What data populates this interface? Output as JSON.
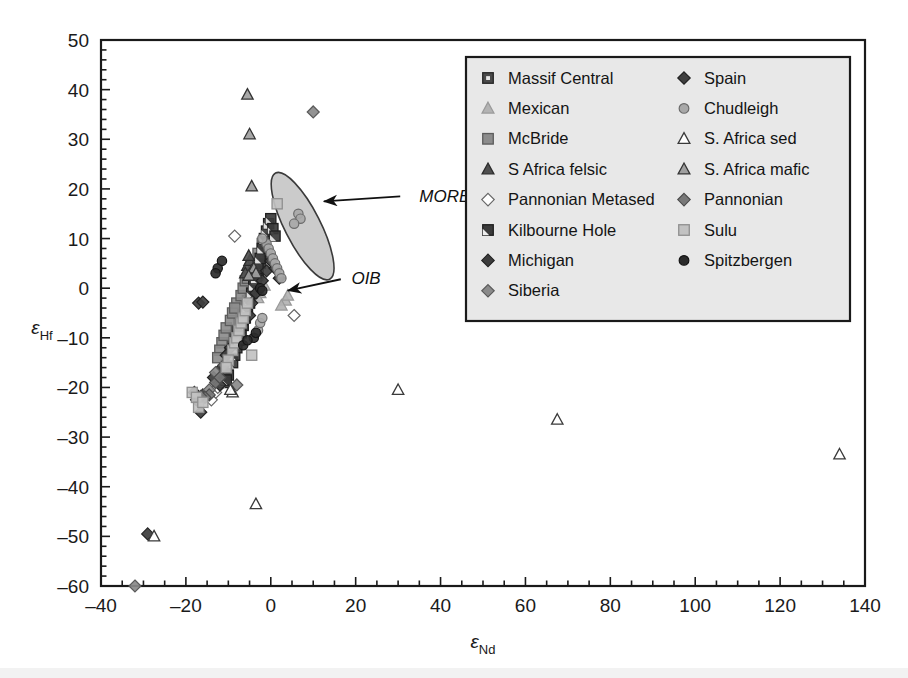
{
  "chart_data": {
    "type": "scatter",
    "title": "",
    "xlabel": "εNd",
    "ylabel": "εHf",
    "xlabel_base": "ε",
    "xlabel_sub": "Nd",
    "ylabel_base": "ε",
    "ylabel_sub": "Hf",
    "xlim": [
      -40,
      140
    ],
    "ylim": [
      -60,
      50
    ],
    "x_major_step": 20,
    "x_minor_step": 5,
    "y_major_step": 10,
    "y_minor_step": 2,
    "x_ticks": [
      -40,
      -20,
      0,
      20,
      40,
      60,
      80,
      100,
      120,
      140
    ],
    "y_ticks": [
      50,
      40,
      30,
      20,
      10,
      0,
      -10,
      -20,
      -30,
      -40,
      -50,
      -60
    ],
    "grid": false,
    "legend_position": "top-right",
    "annotations": [
      {
        "name": "MORB",
        "label": "MORB",
        "text_x": 35,
        "text_y": 18.5,
        "arrow_from_x": 30.5,
        "arrow_from_y": 18.5,
        "arrow_to_x": 12.5,
        "arrow_to_y": 17.5
      },
      {
        "name": "OIB",
        "label": "OIB",
        "text_x": 19,
        "text_y": 2.0,
        "arrow_from_x": 16.5,
        "arrow_from_y": 1.8,
        "arrow_to_x": 4.0,
        "arrow_to_y": -0.5
      }
    ],
    "fields": [
      {
        "name": "MORB-field",
        "fill": "#b9b9b9",
        "stroke": "#3a3a3a",
        "cx": 7.5,
        "cy": 12.5,
        "rx": 4.2,
        "ry": 12.0,
        "rotate": -27
      }
    ],
    "series": [
      {
        "name": "Massif Central",
        "marker": "square-notch",
        "fill": "#4a4a4a",
        "stroke": "#262626",
        "points": [
          [
            -9.5,
            -12.5
          ],
          [
            -9,
            -11
          ],
          [
            -8.5,
            -9.5
          ],
          [
            -8,
            -8.5
          ],
          [
            -7.5,
            -7
          ],
          [
            -7,
            -6
          ],
          [
            -6.5,
            -5
          ],
          [
            -6,
            -3.5
          ],
          [
            -5.5,
            -2.5
          ],
          [
            -5,
            -1.5
          ],
          [
            -4.5,
            -0.5
          ],
          [
            -4,
            1
          ],
          [
            -3.5,
            2
          ],
          [
            -3,
            3.5
          ],
          [
            -2.5,
            5
          ],
          [
            -2,
            6.5
          ],
          [
            -10,
            -14
          ],
          [
            -10.5,
            -15.5
          ],
          [
            -11,
            -17
          ],
          [
            -6,
            -4.5
          ],
          [
            -3,
            2.5
          ],
          [
            -1.5,
            7.5
          ]
        ]
      },
      {
        "name": "Mexican",
        "marker": "triangle",
        "fill": "#b3b3b3",
        "stroke": "#9a9a9a",
        "points": [
          [
            -2.5,
            -1
          ],
          [
            -1.5,
            0.5
          ],
          [
            3.5,
            -2.5
          ],
          [
            4,
            -1.5
          ],
          [
            -3,
            -2
          ],
          [
            2.5,
            -3.5
          ]
        ]
      },
      {
        "name": "McBride",
        "marker": "square",
        "fill": "#8c8c8c",
        "stroke": "#5c5c5c",
        "points": [
          [
            -11.5,
            -11
          ],
          [
            -11,
            -9.5
          ],
          [
            -10.5,
            -8
          ],
          [
            -9.5,
            -6.5
          ],
          [
            -9,
            -5
          ],
          [
            -8,
            -3
          ],
          [
            -7,
            -1.5
          ],
          [
            -6.5,
            0
          ],
          [
            -6,
            1.5
          ],
          [
            -5,
            3
          ],
          [
            -4,
            5
          ],
          [
            -3,
            7
          ],
          [
            -2,
            9
          ],
          [
            -12,
            -12.5
          ],
          [
            -12.5,
            -14
          ],
          [
            -8.5,
            -4
          ],
          [
            -5.5,
            2
          ]
        ]
      },
      {
        "name": "S Africa felsic",
        "marker": "triangle",
        "fill": "#4f4f4f",
        "stroke": "#2c2c2c",
        "points": [
          [
            -5.5,
            4.5
          ],
          [
            -5,
            5.5
          ],
          [
            -4.5,
            3.5
          ],
          [
            -6,
            3
          ],
          [
            -5.2,
            6.5
          ]
        ]
      },
      {
        "name": "Pannonian Metased",
        "marker": "diamond",
        "fill": "#ffffff",
        "stroke": "#666666",
        "points": [
          [
            -8.5,
            10.5
          ],
          [
            -13,
            -21
          ],
          [
            -14,
            -22.5
          ],
          [
            5.5,
            -5.5
          ],
          [
            -12.5,
            -20
          ]
        ]
      },
      {
        "name": "Kilbourne Hole",
        "marker": "square-corner",
        "fill": "#3b3b3b",
        "stroke": "#1f1f1f",
        "points": [
          [
            -10,
            -17.5
          ],
          [
            -9,
            -15
          ],
          [
            -8.5,
            -13.5
          ],
          [
            -8,
            -12
          ],
          [
            -7.5,
            -10.5
          ],
          [
            -7,
            -9
          ],
          [
            -6.5,
            -7.5
          ],
          [
            -6,
            -6
          ],
          [
            -5.5,
            -4.5
          ],
          [
            -5,
            -3
          ],
          [
            -4.5,
            -1
          ],
          [
            -4,
            0.5
          ],
          [
            -3.5,
            2
          ],
          [
            -3,
            4
          ],
          [
            -2.5,
            6
          ],
          [
            -2,
            8
          ],
          [
            -1.5,
            10
          ],
          [
            -1,
            11.5
          ],
          [
            -0.5,
            13
          ],
          [
            0,
            14
          ],
          [
            -11,
            -19
          ],
          [
            -10.5,
            -18.5
          ],
          [
            0.5,
            12
          ],
          [
            1,
            10.5
          ]
        ]
      },
      {
        "name": "Michigan",
        "marker": "diamond",
        "fill": "#3c3c3c",
        "stroke": "#222222",
        "points": [
          [
            -17,
            -3
          ],
          [
            -16,
            -21.5
          ],
          [
            -17.5,
            -22.5
          ],
          [
            -16.5,
            -25
          ],
          [
            -18,
            -21
          ],
          [
            -29,
            -49.5
          ],
          [
            -13.5,
            -18
          ],
          [
            -11.5,
            -16
          ],
          [
            -12,
            -19.5
          ]
        ]
      },
      {
        "name": "Siberia",
        "marker": "diamond",
        "fill": "#8a8a8a",
        "stroke": "#5a5a5a",
        "points": [
          [
            10,
            35.5
          ],
          [
            -32,
            -60
          ],
          [
            -14.5,
            -20.5
          ],
          [
            -13,
            -17
          ],
          [
            -8,
            -19.5
          ]
        ]
      },
      {
        "name": "Spain",
        "marker": "diamond",
        "fill": "#3f3f3f",
        "stroke": "#212121",
        "points": [
          [
            -16,
            -2.8
          ],
          [
            -9.5,
            -12
          ],
          [
            -7.5,
            -9
          ],
          [
            -6.5,
            -7
          ],
          [
            -5,
            -5.5
          ],
          [
            -4.5,
            -3
          ],
          [
            -3.5,
            -1
          ],
          [
            -2,
            1.5
          ],
          [
            -1,
            3.5
          ],
          [
            0,
            5.5
          ],
          [
            1,
            4
          ],
          [
            2,
            2
          ],
          [
            -10.5,
            -13.5
          ]
        ]
      },
      {
        "name": "Chudleigh",
        "marker": "circle",
        "fill": "#a8a8a8",
        "stroke": "#6b6b6b",
        "points": [
          [
            6.5,
            15
          ],
          [
            7,
            14
          ],
          [
            5.5,
            13
          ],
          [
            -1,
            9
          ],
          [
            -0.5,
            8
          ],
          [
            0,
            7
          ],
          [
            0.5,
            6
          ],
          [
            1,
            5
          ],
          [
            1.5,
            4
          ],
          [
            2,
            3
          ],
          [
            2.5,
            2
          ],
          [
            -2,
            10
          ],
          [
            -3,
            -8.5
          ],
          [
            -2.5,
            -7
          ],
          [
            -2,
            -6
          ]
        ]
      },
      {
        "name": "S. Africa sed",
        "marker": "triangle-open",
        "fill": "#ffffff",
        "stroke": "#3a3a3a",
        "points": [
          [
            30,
            -20.5
          ],
          [
            67.5,
            -26.5
          ],
          [
            134,
            -33.5
          ],
          [
            -3.5,
            -43.5
          ],
          [
            -9,
            -21
          ],
          [
            -27.5,
            -50
          ],
          [
            -9.5,
            -20.5
          ]
        ]
      },
      {
        "name": "S. Africa mafic",
        "marker": "triangle",
        "fill": "#a0a0a0",
        "stroke": "#333333",
        "points": [
          [
            -5.5,
            39
          ],
          [
            -5,
            31
          ],
          [
            -4.5,
            20.5
          ],
          [
            -4,
            4
          ],
          [
            -3.5,
            3
          ],
          [
            -5.2,
            2.5
          ]
        ]
      },
      {
        "name": "Pannonian",
        "marker": "diamond",
        "fill": "#787878",
        "stroke": "#4c4c4c",
        "points": [
          [
            -13,
            -19
          ],
          [
            -12,
            -18
          ],
          [
            -14.5,
            -21.5
          ],
          [
            -15.5,
            -22
          ],
          [
            -11,
            -15.5
          ],
          [
            -16.5,
            -21.8
          ]
        ]
      },
      {
        "name": "Sulu",
        "marker": "square",
        "fill": "#c2c2c2",
        "stroke": "#8f8f8f",
        "points": [
          [
            -18.5,
            -21
          ],
          [
            -17.5,
            -22
          ],
          [
            -17,
            -24
          ],
          [
            -16,
            -23
          ],
          [
            -9,
            -12.5
          ],
          [
            -8.5,
            -11
          ],
          [
            -8,
            -10
          ],
          [
            -7.5,
            -8.5
          ],
          [
            -7,
            -7
          ],
          [
            -6.5,
            -6
          ],
          [
            -6,
            -4.5
          ],
          [
            -5.5,
            -3
          ],
          [
            1.5,
            17
          ],
          [
            -4.5,
            -13.5
          ],
          [
            -10,
            -14.5
          ],
          [
            -10.5,
            -16
          ]
        ]
      },
      {
        "name": "Spitzbergen",
        "marker": "circle",
        "fill": "#2b2b2b",
        "stroke": "#141414",
        "points": [
          [
            -12.5,
            4
          ],
          [
            -11.5,
            5.5
          ],
          [
            -2.5,
            0
          ],
          [
            -2,
            -0.5
          ],
          [
            -4,
            -10
          ],
          [
            -3.5,
            -9
          ],
          [
            -6.5,
            -11.5
          ],
          [
            -5.5,
            -10.5
          ],
          [
            -13,
            3
          ]
        ]
      }
    ]
  },
  "legend": {
    "title": "",
    "columns": [
      [
        {
          "label": "Massif Central",
          "marker": "square-notch"
        },
        {
          "label": "Mexican",
          "marker": "triangle"
        },
        {
          "label": "McBride",
          "marker": "square"
        },
        {
          "label": "S Africa felsic",
          "marker": "triangle"
        },
        {
          "label": "Pannonian Metased",
          "marker": "diamond"
        },
        {
          "label": "Kilbourne Hole",
          "marker": "square-corner"
        },
        {
          "label": "Michigan",
          "marker": "diamond"
        },
        {
          "label": "Siberia",
          "marker": "diamond"
        }
      ],
      [
        {
          "label": "Spain",
          "marker": "diamond"
        },
        {
          "label": "Chudleigh",
          "marker": "circle"
        },
        {
          "label": "S. Africa sed",
          "marker": "triangle-open"
        },
        {
          "label": "S. Africa mafic",
          "marker": "triangle"
        },
        {
          "label": "Pannonian",
          "marker": "diamond"
        },
        {
          "label": "Sulu",
          "marker": "square"
        },
        {
          "label": "Spitzbergen",
          "marker": "circle"
        }
      ]
    ],
    "background": "#e8e8e8",
    "border": "#1a1a1a"
  },
  "colors": {
    "axis": "#1a1a1a",
    "background": "#ffffff",
    "morb_field_fill": "#b9b9b9",
    "legend_bg": "#e8e8e8"
  }
}
